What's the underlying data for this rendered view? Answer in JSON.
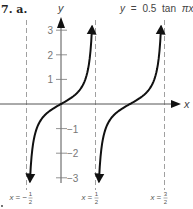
{
  "problem": {
    "number": "7.",
    "part": "a."
  },
  "chart_data": {
    "type": "line",
    "title": "y = 0.5 tan πx",
    "equation": {
      "lhs": "y",
      "rhs_coef": "0.5",
      "rhs_fn": "tan",
      "rhs_arg": "πx"
    },
    "function": "y = 0.5*tan(pi*x)",
    "xlabel": "x",
    "ylabel": "y",
    "xlim": [
      -0.5,
      1.5
    ],
    "ylim": [
      -3,
      3
    ],
    "yticks": [
      3,
      2,
      1,
      -1,
      -2,
      -3
    ],
    "ytick_labels": [
      "3",
      "2",
      "1",
      "−1",
      "−2",
      "−3"
    ],
    "grid": false,
    "asymptotes": [
      {
        "x": -0.5,
        "label_lhs": "x",
        "label_sign": "−",
        "num": "1",
        "den": "2"
      },
      {
        "x": 0.5,
        "label_lhs": "x",
        "label_sign": "",
        "num": "1",
        "den": "2"
      },
      {
        "x": 1.5,
        "label_lhs": "x",
        "label_sign": "",
        "num": "3",
        "den": "2"
      }
    ],
    "branches": [
      {
        "x_range": [
          -0.5,
          0.5
        ],
        "passes_through": [
          0,
          0
        ]
      },
      {
        "x_range": [
          0.5,
          1.5
        ],
        "passes_through": [
          1,
          0
        ]
      }
    ],
    "colors": {
      "curve": "#111111",
      "axes": "#555555",
      "asymptote": "#888888",
      "ticks": "#777777"
    }
  }
}
